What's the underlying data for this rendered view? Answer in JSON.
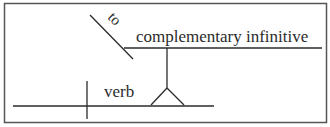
{
  "diagram": {
    "type": "sentence-diagram",
    "labels": {
      "to": "to",
      "complementary_infinitive": "complementary infinitive",
      "verb": "verb"
    },
    "colors": {
      "line": "#2b2b2b",
      "border": "#555555",
      "background": "#ffffff"
    }
  }
}
